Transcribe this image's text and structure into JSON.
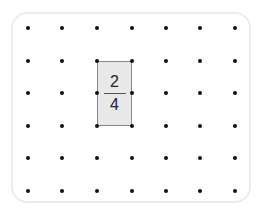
{
  "grid": {
    "xs": [
      28,
      62,
      97,
      132,
      166,
      200,
      235
    ],
    "ys": [
      28,
      61,
      93,
      126,
      158,
      191
    ]
  },
  "shape": {
    "x1": 97,
    "y1": 61,
    "x2": 132,
    "y2": 126,
    "fill": "#e8e8e8",
    "stroke": "#888888"
  },
  "fraction": {
    "numerator": "2",
    "denominator": "4"
  }
}
